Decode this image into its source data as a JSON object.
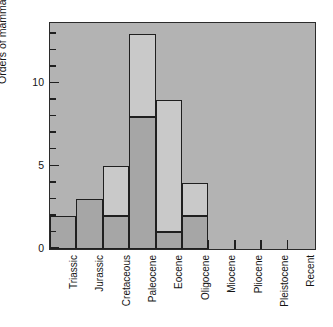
{
  "chart_data": {
    "type": "bar",
    "title": "",
    "subtitle": "",
    "xlabel": "",
    "ylabel": "Orders of mammals",
    "categories": [
      "Triassic",
      "Jurassic",
      "Cretaceous",
      "Paleocene",
      "Eocene",
      "Oligocene",
      "Miocene",
      "Pliocene",
      "Pleistocene",
      "Recent"
    ],
    "values": [
      2,
      3,
      5,
      13,
      9,
      4,
      0,
      0,
      0,
      0
    ],
    "series": [
      {
        "name": "lower-segment",
        "values": [
          2,
          3,
          2,
          8,
          1,
          2,
          0,
          0,
          0,
          0
        ]
      },
      {
        "name": "upper-segment",
        "values": [
          0,
          0,
          3,
          5,
          8,
          2,
          0,
          0,
          0,
          0
        ]
      }
    ],
    "ylim": [
      0,
      13.6
    ],
    "ytick_labels": [
      "0",
      "5",
      "10"
    ],
    "ytick_values": [
      0,
      5,
      10
    ],
    "yminor_step": 1,
    "grid": false,
    "legend": "none",
    "colors": {
      "plot_background": "#b3b3b3",
      "segment_lower": "#a6a6a6",
      "segment_upper": "#c9c9c9",
      "outline": "#1f1f1f",
      "text": "#141414",
      "page_background": "#ffffff"
    }
  }
}
